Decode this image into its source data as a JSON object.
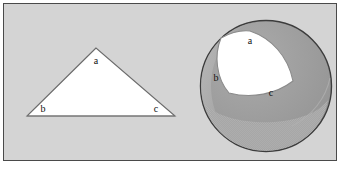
{
  "figure": {
    "background_color": "#d4d4d4",
    "frame_border_color": "#4a4a4a",
    "page_background": "#ffffff"
  },
  "planar_triangle": {
    "name": "planar-triangle",
    "fill_color": "#ffffff",
    "stroke_color": "#6b6b6b",
    "vertices": [
      {
        "id": "a",
        "label": "a",
        "x": 96,
        "y": 48,
        "label_x": 96,
        "label_y": 61
      },
      {
        "id": "b",
        "label": "b",
        "x": 27,
        "y": 116,
        "label_x": 43,
        "label_y": 109
      },
      {
        "id": "c",
        "label": "c",
        "x": 175,
        "y": 116,
        "label_x": 156,
        "label_y": 109
      }
    ],
    "points_path": "96,48 27,116 175,116"
  },
  "sphere": {
    "name": "sphere",
    "center_x": 266,
    "center_y": 86,
    "radius": 66,
    "fill_color": "#9e9e9e",
    "stroke_color": "#3c3c3c",
    "limb_highlight_color": "#b8b8b8",
    "shading_band_color": "#a8a8a8"
  },
  "spherical_triangle": {
    "name": "spherical-triangle",
    "fill_color": "#ffffff",
    "stroke_color": "#8a8a8a",
    "path": "M 250 31 C 271 38 288 56 293 81 C 276 94 252 99 229 93 C 216 78 214 55 221 38 C 230 33 240 30 250 31 Z",
    "vertices": [
      {
        "id": "a",
        "label": "a",
        "x": 250,
        "y": 31,
        "label_x": 250,
        "label_y": 41
      },
      {
        "id": "b",
        "label": "b",
        "x": 215,
        "y": 75,
        "label_x": 216,
        "label_y": 78
      },
      {
        "id": "c",
        "label": "c",
        "x": 272,
        "y": 97,
        "label_x": 271,
        "label_y": 93
      }
    ]
  },
  "labels": {
    "letter_a": "a",
    "letter_b": "b",
    "letter_c": "c"
  }
}
